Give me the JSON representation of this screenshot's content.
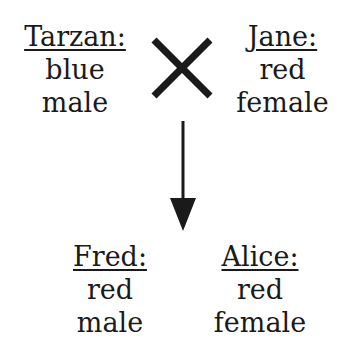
{
  "parents": [
    {
      "id": "tarzan",
      "name": "Tarzan:",
      "color": "blue",
      "sex": "male"
    },
    {
      "id": "jane",
      "name": "Jane:",
      "color": "red",
      "sex": "female"
    }
  ],
  "offspring": [
    {
      "id": "fred",
      "name": "Fred:",
      "color": "red",
      "sex": "male"
    },
    {
      "id": "alice",
      "name": "Alice:",
      "color": "red",
      "sex": "female"
    }
  ],
  "symbols": {
    "cross": "cross-icon",
    "arrow": "down-arrow-icon"
  }
}
